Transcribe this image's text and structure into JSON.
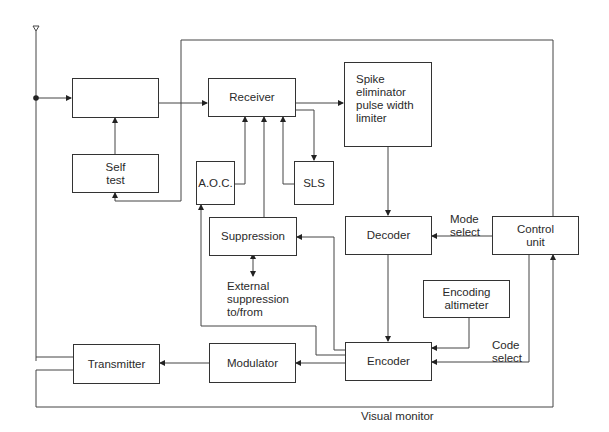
{
  "diagram": {
    "type": "block-diagram",
    "blocks": {
      "filter": {
        "label": "",
        "icon": "bandpass-filter-icon"
      },
      "self_test": {
        "label": "Self\ntest"
      },
      "receiver": {
        "label": "Receiver"
      },
      "spike_eliminator": {
        "label": "Spike\neliminator\npulse width\nlimiter"
      },
      "aoc": {
        "label": "A.O.C."
      },
      "sls": {
        "label": "SLS"
      },
      "suppression": {
        "label": "Suppression"
      },
      "decoder": {
        "label": "Decoder"
      },
      "control_unit": {
        "label": "Control\nunit"
      },
      "encoding_altimeter": {
        "label": "Encoding\naltimeter"
      },
      "encoder": {
        "label": "Encoder"
      },
      "modulator": {
        "label": "Modulator"
      },
      "transmitter": {
        "label": "Transmitter"
      }
    },
    "annotations": {
      "mode_select": "Mode\nselect",
      "code_select": "Code\nselect",
      "external_suppression": "External\nsuppression\nto/from",
      "visual_monitor": "Visual monitor"
    },
    "connections": [
      {
        "from": "antenna",
        "to": "filter"
      },
      {
        "from": "self_test",
        "to": "filter"
      },
      {
        "from": "filter",
        "to": "receiver"
      },
      {
        "from": "receiver",
        "to": "spike_eliminator"
      },
      {
        "from": "receiver",
        "to": "sls"
      },
      {
        "from": "aoc",
        "to": "receiver"
      },
      {
        "from": "suppression",
        "to": "receiver"
      },
      {
        "from": "sls",
        "to": "receiver"
      },
      {
        "from": "spike_eliminator",
        "to": "decoder"
      },
      {
        "from": "control_unit",
        "to": "decoder",
        "label": "Mode select"
      },
      {
        "from": "decoder",
        "to": "encoder"
      },
      {
        "from": "encoding_altimeter",
        "to": "encoder"
      },
      {
        "from": "control_unit",
        "to": "encoder",
        "label": "Code select"
      },
      {
        "from": "encoder",
        "to": "suppression"
      },
      {
        "from": "encoder",
        "to": "aoc"
      },
      {
        "from": "encoder",
        "to": "modulator"
      },
      {
        "from": "modulator",
        "to": "transmitter"
      },
      {
        "from": "transmitter",
        "to": "antenna"
      },
      {
        "from": "transmitter",
        "to": "control_unit",
        "label": "Visual monitor"
      },
      {
        "from": "control_unit",
        "to": "self_test"
      },
      {
        "from": "suppression",
        "to": "external",
        "bidirectional": true,
        "label": "External suppression to/from"
      }
    ]
  }
}
